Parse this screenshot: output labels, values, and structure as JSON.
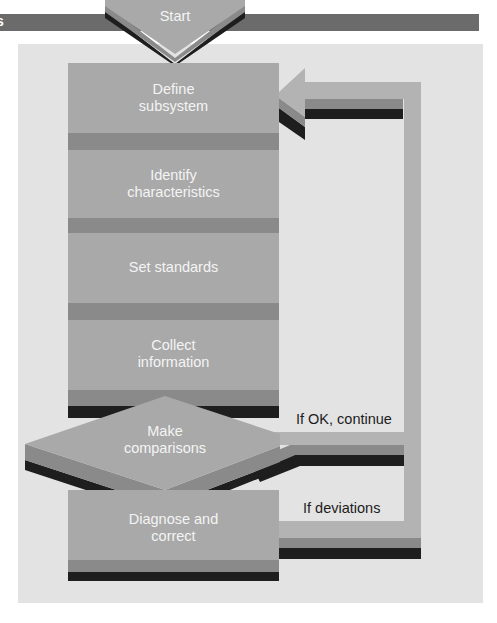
{
  "diagram": {
    "type": "flowchart",
    "header_edge_glyph": "s",
    "start": {
      "label": "Start"
    },
    "steps": [
      {
        "id": "define",
        "label_line1": "Define",
        "label_line2": "subsystem"
      },
      {
        "id": "identify",
        "label_line1": "Identify",
        "label_line2": "characteristics"
      },
      {
        "id": "standards",
        "label_line1": "Set standards",
        "label_line2": ""
      },
      {
        "id": "collect",
        "label_line1": "Collect",
        "label_line2": "information"
      }
    ],
    "decision": {
      "label_line1": "Make",
      "label_line2": "comparisons"
    },
    "correction": {
      "label_line1": "Diagnose and",
      "label_line2": "correct"
    },
    "edges": {
      "ok": "If OK, continue",
      "deviations": "If deviations"
    },
    "colors": {
      "header_bar": "#6b6b6b",
      "panel": "#e3e3e3",
      "box_face": "#a9a9a9",
      "box_band": "#8a8a8a",
      "box_shadow": "#1e1e1e",
      "loop": "#b3b3b3"
    }
  }
}
